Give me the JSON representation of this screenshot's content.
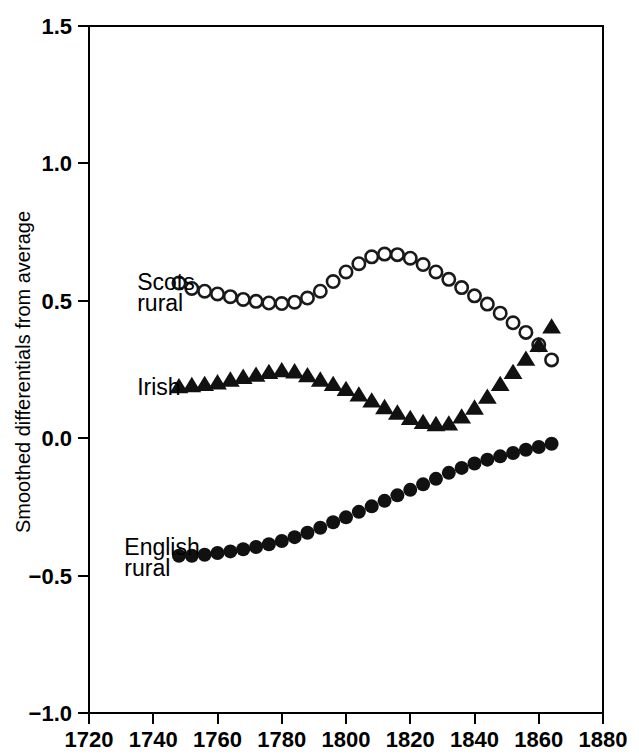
{
  "chart_data": {
    "type": "scatter",
    "title": "",
    "xlabel": "",
    "ylabel": "Smoothed differentials from average",
    "xlim": [
      1720,
      1880
    ],
    "ylim": [
      -1.0,
      1.5
    ],
    "xticks": [
      1720,
      1740,
      1760,
      1780,
      1800,
      1820,
      1840,
      1860,
      1880
    ],
    "yticks": [
      -1.0,
      -0.5,
      0.0,
      0.5,
      1.0,
      1.5
    ],
    "xtick_labels": [
      "1720",
      "1740",
      "1760",
      "1780",
      "1800",
      "1820",
      "1840",
      "1860",
      "1880"
    ],
    "ytick_labels": [
      "-1.0",
      "-0.5",
      "0.0",
      "0.5",
      "1.0",
      "1.5"
    ],
    "grid": false,
    "legend_position": "inline-annotations",
    "series": [
      {
        "name": "Scots rural",
        "marker": "open-circle",
        "color": "#1a1a1a",
        "label_lines": [
          "Scots",
          "rural"
        ],
        "x": [
          1748,
          1752,
          1756,
          1760,
          1764,
          1768,
          1772,
          1776,
          1780,
          1784,
          1788,
          1792,
          1796,
          1800,
          1804,
          1808,
          1812,
          1816,
          1820,
          1824,
          1828,
          1832,
          1836,
          1840,
          1844,
          1848,
          1852,
          1856,
          1860,
          1864
        ],
        "values": [
          0.565,
          0.545,
          0.535,
          0.525,
          0.515,
          0.505,
          0.498,
          0.492,
          0.49,
          0.495,
          0.51,
          0.535,
          0.57,
          0.605,
          0.635,
          0.66,
          0.67,
          0.668,
          0.655,
          0.632,
          0.605,
          0.578,
          0.548,
          0.518,
          0.488,
          0.455,
          0.42,
          0.385,
          0.34,
          0.285
        ]
      },
      {
        "name": "Irish",
        "marker": "filled-triangle",
        "color": "#111111",
        "label_lines": [
          "Irish"
        ],
        "x": [
          1748,
          1752,
          1756,
          1760,
          1764,
          1768,
          1772,
          1776,
          1780,
          1784,
          1788,
          1792,
          1796,
          1800,
          1804,
          1808,
          1812,
          1816,
          1820,
          1824,
          1828,
          1832,
          1836,
          1840,
          1844,
          1848,
          1852,
          1856,
          1860,
          1864
        ],
        "values": [
          0.188,
          0.192,
          0.196,
          0.202,
          0.212,
          0.222,
          0.23,
          0.24,
          0.246,
          0.242,
          0.228,
          0.212,
          0.196,
          0.178,
          0.158,
          0.136,
          0.112,
          0.092,
          0.072,
          0.058,
          0.05,
          0.052,
          0.078,
          0.11,
          0.15,
          0.196,
          0.24,
          0.288,
          0.338,
          0.405
        ]
      },
      {
        "name": "English rural",
        "marker": "filled-circle",
        "color": "#111111",
        "label_lines": [
          "English",
          "rural"
        ],
        "x": [
          1748,
          1752,
          1756,
          1760,
          1764,
          1768,
          1772,
          1776,
          1780,
          1784,
          1788,
          1792,
          1796,
          1800,
          1804,
          1808,
          1812,
          1816,
          1820,
          1824,
          1828,
          1832,
          1836,
          1840,
          1844,
          1848,
          1852,
          1856,
          1860,
          1864
        ],
        "values": [
          -0.428,
          -0.428,
          -0.424,
          -0.418,
          -0.412,
          -0.404,
          -0.396,
          -0.386,
          -0.374,
          -0.36,
          -0.344,
          -0.326,
          -0.306,
          -0.288,
          -0.268,
          -0.248,
          -0.228,
          -0.208,
          -0.188,
          -0.168,
          -0.148,
          -0.126,
          -0.108,
          -0.092,
          -0.078,
          -0.066,
          -0.054,
          -0.042,
          -0.032,
          -0.02
        ]
      }
    ],
    "annotations": [
      {
        "text": "Scots",
        "x": 1735,
        "y": 0.57
      },
      {
        "text": "rural",
        "x": 1735,
        "y": 0.492
      },
      {
        "text": "Irish",
        "x": 1735,
        "y": 0.185
      },
      {
        "text": "English",
        "x": 1731,
        "y": -0.395
      },
      {
        "text": "rural",
        "x": 1731,
        "y": -0.472
      }
    ]
  }
}
